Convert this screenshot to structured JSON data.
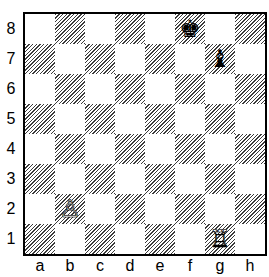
{
  "board": {
    "ranks": [
      "8",
      "7",
      "6",
      "5",
      "4",
      "3",
      "2",
      "1"
    ],
    "files": [
      "a",
      "b",
      "c",
      "d",
      "e",
      "f",
      "g",
      "h"
    ],
    "light_color": "#ffffff",
    "dark_pattern": "diagonal-hatch",
    "pieces": [
      {
        "square": "f8",
        "piece": "king",
        "color": "black",
        "glyph": "♚"
      },
      {
        "square": "g7",
        "piece": "bishop",
        "color": "black",
        "glyph": "♝"
      },
      {
        "square": "b2",
        "piece": "pawn",
        "color": "white",
        "glyph": "♙"
      },
      {
        "square": "g1",
        "piece": "rook",
        "color": "white",
        "glyph": "♖"
      }
    ]
  }
}
